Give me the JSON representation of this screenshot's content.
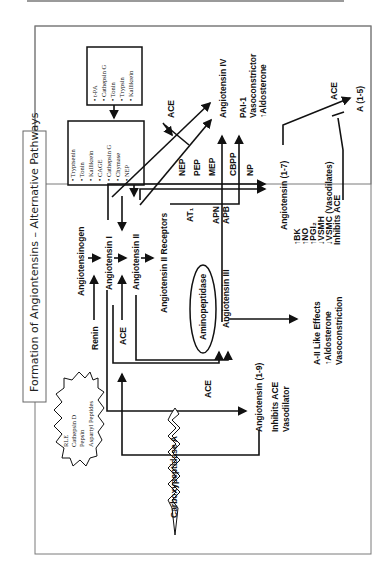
{
  "title": "Formation of Angiontensins – Alternative Pathways",
  "orientation": "rotated 90° counter-clockwise",
  "starburst_left": {
    "items": [
      "RLE",
      "Cathepsin D",
      "Pepsin",
      "Aspartyl Peptides"
    ]
  },
  "box_top": {
    "items": [
      "• t-PA",
      "• Cathepsin G",
      "• Tonin",
      "• Trypsin",
      "• Kallikrein"
    ]
  },
  "box_mid": {
    "items": [
      "• Tryptsenin",
      "• Tonin",
      "• Kallikrein",
      "• CAGE",
      "• Cathepsin G",
      "• Chymase",
      "• NEP"
    ]
  },
  "nodes": {
    "angiotensinogen": "Angiotensinogen",
    "renin": "Renin",
    "ang1": "Angiotensin I",
    "ace1": "ACE",
    "ang2": "Angiotensin II",
    "ang2_receptors": "Angiotensin II Receptors",
    "at1": "AT₁",
    "apn": "APN",
    "apb": "APB",
    "aminopeptidase": "Aminopeptidase",
    "ang3": "Angiotensin III",
    "ang3_effects": [
      "A-II Like Effects",
      "↑Aldosterone",
      "Vasoconstriction"
    ],
    "ace2": "ACE",
    "ang19": "Angiotensin (1-9)",
    "ang19_effects": [
      "Inhibits ACE",
      "Vasodilator"
    ],
    "carboxypeptidase": "Carboxypeptidase A",
    "nep": "NEP",
    "pep": "PEP",
    "mep": "MEP",
    "cbpp": "CBPP",
    "np": "NP",
    "ace_top": "ACE",
    "ang4": "Angiotensin IV",
    "ang4_effects": [
      "PAI-1",
      "Vasoconstrictor",
      "↑Aldosterone"
    ],
    "ang17": "Angiotensin (1-7)",
    "ang17_effects": [
      "↑BK",
      "↑NO",
      "↑PGI₂",
      "↓VSMH",
      "↓VSMC (Vasodilates)",
      "Inhibits ACE"
    ],
    "ace_right": "ACE",
    "a15": "A (1-5)"
  },
  "colors": {
    "ink": "#111111",
    "frame": "#7a7a7a",
    "background": "#ffffff"
  }
}
